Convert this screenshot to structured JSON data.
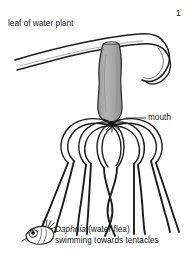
{
  "figure": {
    "number": "1",
    "labels": {
      "leaf": "leaf of water plant",
      "mouth": "mouth"
    },
    "caption": {
      "species_name": "Daphnia",
      "common_name": "(water flea)",
      "line_2": "swimming towards tentacles"
    },
    "colors": {
      "ink": "#141414",
      "body_fill": "#a8a8a8",
      "paper": "#ffffff"
    }
  }
}
